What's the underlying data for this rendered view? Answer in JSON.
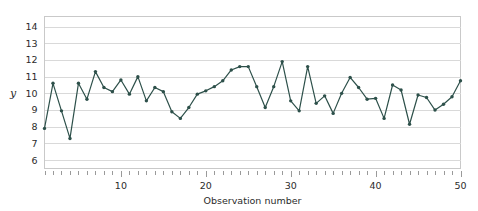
{
  "chart_data": {
    "type": "line",
    "title": "",
    "xlabel": "Observation number",
    "ylabel": "y",
    "xlim": [
      1,
      50
    ],
    "ylim": [
      5.5,
      14.6
    ],
    "grid": true,
    "legend": false,
    "legend_position": "none",
    "x_tick_labels": [
      "10",
      "20",
      "30",
      "40",
      "50"
    ],
    "x_tick_values": [
      10,
      20,
      30,
      40,
      50
    ],
    "x_minor_ticks_every": 1,
    "y_tick_labels": [
      "14",
      "13",
      "12",
      "11",
      "10",
      "9",
      "8",
      "7",
      "6"
    ],
    "y_tick_values": [
      14,
      13,
      12,
      11,
      10,
      9,
      8,
      7,
      6
    ],
    "series": [
      {
        "name": "y",
        "color": "#2d504a",
        "marker": "circle",
        "x": [
          1,
          2,
          3,
          4,
          5,
          6,
          7,
          8,
          9,
          10,
          11,
          12,
          13,
          14,
          15,
          16,
          17,
          18,
          19,
          20,
          21,
          22,
          23,
          24,
          25,
          26,
          27,
          28,
          29,
          30,
          31,
          32,
          33,
          34,
          35,
          36,
          37,
          38,
          39,
          40,
          41,
          42,
          43,
          44,
          45,
          46,
          47,
          48,
          49,
          50
        ],
        "values": [
          7.9,
          10.6,
          8.95,
          7.3,
          10.6,
          9.65,
          11.3,
          10.35,
          10.1,
          10.8,
          9.95,
          11.0,
          9.55,
          10.35,
          10.1,
          8.9,
          8.5,
          9.15,
          9.95,
          10.15,
          10.4,
          10.75,
          11.4,
          11.6,
          11.6,
          10.4,
          9.15,
          10.4,
          11.9,
          9.55,
          8.95,
          11.6,
          9.4,
          9.85,
          8.8,
          10.0,
          10.95,
          10.35,
          9.65,
          9.7,
          8.5,
          10.5,
          10.2,
          8.15,
          9.9,
          9.75,
          9.0,
          9.35,
          9.8,
          10.75
        ]
      }
    ]
  },
  "colors": {
    "line": "#2d504a",
    "grid": "#d9d9d9",
    "border": "#c9c9c9",
    "text": "#2b2b2b",
    "background": "#ffffff"
  }
}
